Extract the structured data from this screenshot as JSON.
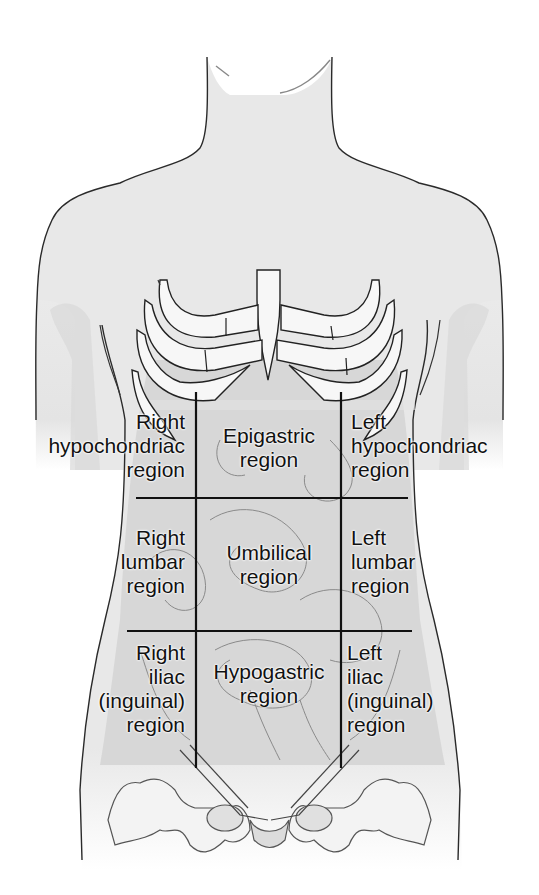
{
  "figure": {
    "colors": {
      "skin": "#ededed",
      "shade": "#d6d6d6",
      "organ": "#d0d0d0",
      "line": "#1a1a1a",
      "bone": "#f7f7f7"
    },
    "grid": {
      "vertical_x": [
        196,
        341
      ],
      "horizontal_y": [
        498,
        631
      ],
      "top_y": 392,
      "bottom_y": 765
    },
    "regions": [
      {
        "id": "right-hypochondriac",
        "lines": [
          "Right",
          "hypochondriac",
          "region"
        ]
      },
      {
        "id": "epigastric",
        "lines": [
          "Epigastric",
          "region"
        ]
      },
      {
        "id": "left-hypochondriac",
        "lines": [
          "Left",
          "hypochondriac",
          "region"
        ]
      },
      {
        "id": "right-lumbar",
        "lines": [
          "Right",
          "lumbar",
          "region"
        ]
      },
      {
        "id": "umbilical",
        "lines": [
          "Umbilical",
          "region"
        ]
      },
      {
        "id": "left-lumbar",
        "lines": [
          "Left",
          "lumbar",
          "region"
        ]
      },
      {
        "id": "right-iliac",
        "lines": [
          "Right",
          "iliac",
          "(inguinal)",
          "region"
        ]
      },
      {
        "id": "hypogastric",
        "lines": [
          "Hypogastric",
          "region"
        ]
      },
      {
        "id": "left-iliac",
        "lines": [
          "Left",
          "iliac",
          "(inguinal)",
          "region"
        ]
      }
    ]
  }
}
